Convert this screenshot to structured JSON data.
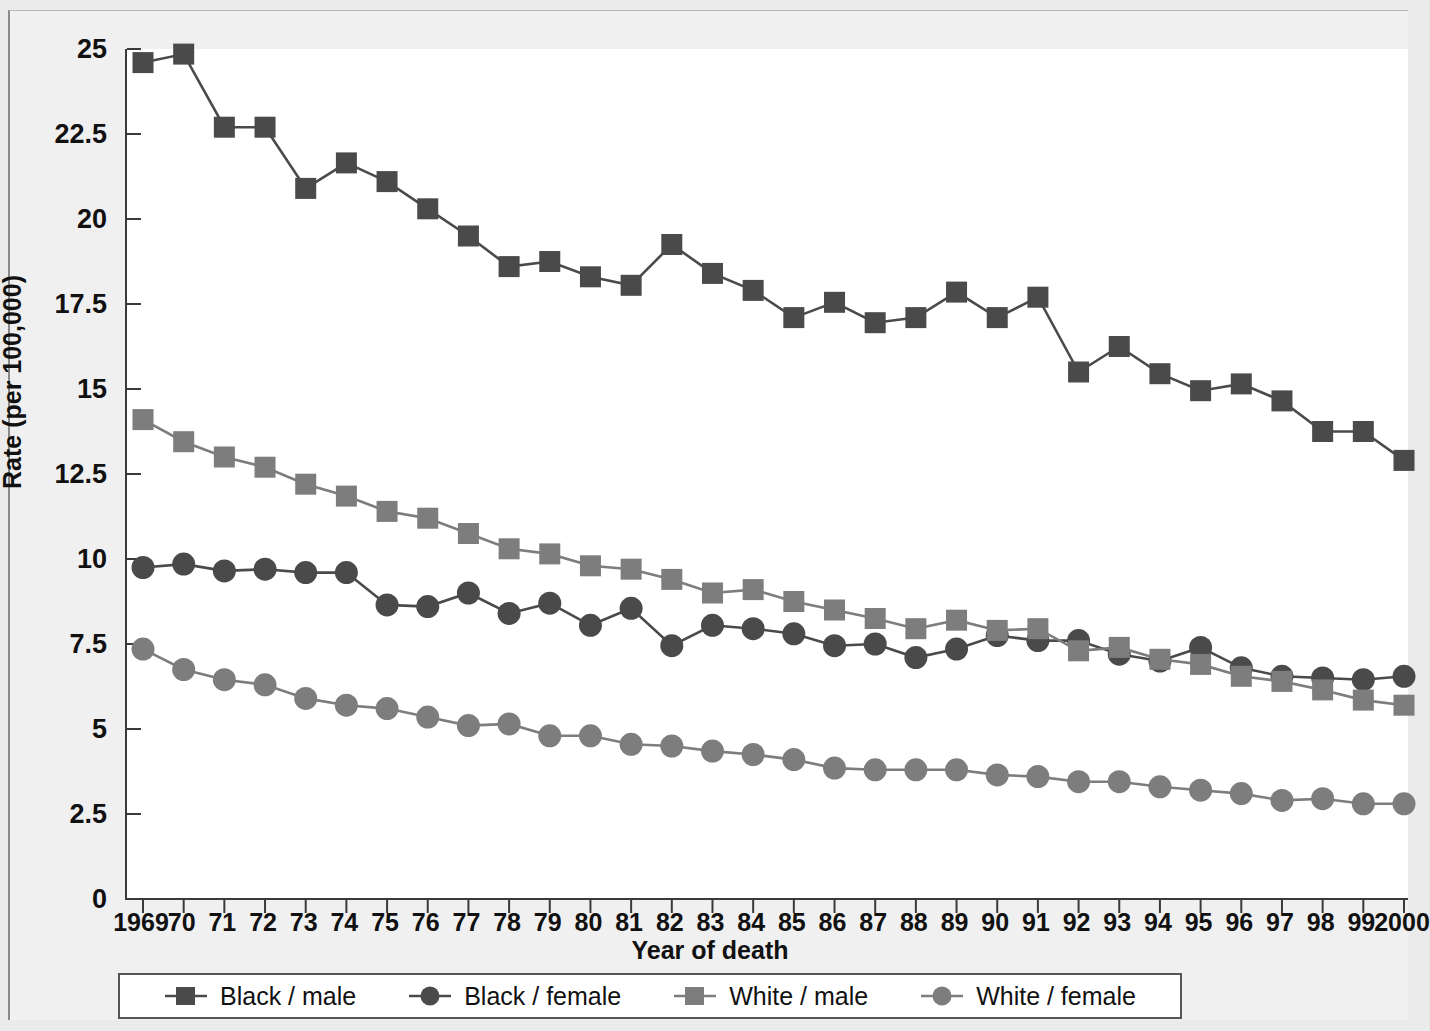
{
  "chart_data": {
    "type": "line",
    "title": "",
    "xlabel": "Year of death",
    "ylabel": "Rate (per 100,000)",
    "xlim": [
      1969,
      2000
    ],
    "ylim": [
      0,
      25
    ],
    "yticks": [
      0,
      2.5,
      5,
      7.5,
      10,
      12.5,
      15,
      17.5,
      20,
      22.5,
      25
    ],
    "ytick_labels": [
      "0",
      "2.5",
      "5",
      "7.5",
      "10",
      "12.5",
      "15",
      "17.5",
      "20",
      "22.5",
      "25"
    ],
    "grid": false,
    "legend_position": "below-axes",
    "x": [
      1969,
      1970,
      1971,
      1972,
      1973,
      1974,
      1975,
      1976,
      1977,
      1978,
      1979,
      1980,
      1981,
      1982,
      1983,
      1984,
      1985,
      1986,
      1987,
      1988,
      1989,
      1990,
      1991,
      1992,
      1993,
      1994,
      1995,
      1996,
      1997,
      1998,
      1999,
      2000
    ],
    "xtick_labels": [
      "1969",
      "70",
      "71",
      "72",
      "73",
      "74",
      "75",
      "76",
      "77",
      "78",
      "79",
      "80",
      "81",
      "82",
      "83",
      "84",
      "85",
      "86",
      "87",
      "88",
      "89",
      "90",
      "91",
      "92",
      "93",
      "94",
      "95",
      "96",
      "97",
      "98",
      "99",
      "2000"
    ],
    "series": [
      {
        "name": "Black / male",
        "marker": "square",
        "color": "#4a4a4a",
        "values": [
          24.6,
          24.85,
          22.7,
          22.7,
          20.9,
          21.65,
          21.1,
          20.3,
          19.5,
          18.6,
          18.75,
          18.3,
          18.05,
          19.25,
          18.4,
          17.9,
          17.1,
          17.55,
          16.95,
          17.1,
          17.85,
          17.1,
          17.7,
          15.5,
          16.25,
          15.45,
          14.95,
          15.15,
          14.65,
          13.75,
          13.75,
          12.9
        ]
      },
      {
        "name": "Black / female",
        "marker": "circle",
        "color": "#4a4a4a",
        "values": [
          9.75,
          9.85,
          9.65,
          9.7,
          9.6,
          9.6,
          8.65,
          8.6,
          9.0,
          8.4,
          8.7,
          8.05,
          8.55,
          7.45,
          8.05,
          7.95,
          7.8,
          7.45,
          7.5,
          7.1,
          7.35,
          7.75,
          7.6,
          7.6,
          7.2,
          7.0,
          7.4,
          6.8,
          6.55,
          6.5,
          6.45,
          6.55
        ]
      },
      {
        "name": "White / male",
        "marker": "square",
        "color": "#7d7d7d",
        "values": [
          14.1,
          13.45,
          13.0,
          12.7,
          12.2,
          11.85,
          11.4,
          11.2,
          10.75,
          10.3,
          10.15,
          9.8,
          9.7,
          9.4,
          9.0,
          9.1,
          8.75,
          8.5,
          8.25,
          7.95,
          8.2,
          7.9,
          7.95,
          7.3,
          7.4,
          7.05,
          6.9,
          6.55,
          6.4,
          6.15,
          5.85,
          5.7
        ]
      },
      {
        "name": "White / female",
        "marker": "circle",
        "color": "#7d7d7d",
        "values": [
          7.35,
          6.75,
          6.45,
          6.3,
          5.9,
          5.7,
          5.6,
          5.35,
          5.1,
          5.15,
          4.8,
          4.8,
          4.55,
          4.5,
          4.35,
          4.25,
          4.1,
          3.85,
          3.8,
          3.8,
          3.8,
          3.65,
          3.6,
          3.45,
          3.45,
          3.3,
          3.2,
          3.1,
          2.9,
          2.95,
          2.8,
          2.8
        ]
      }
    ]
  },
  "legend": {
    "items": [
      {
        "label": "Black / male"
      },
      {
        "label": "Black / female"
      },
      {
        "label": "White / male"
      },
      {
        "label": "White / female"
      }
    ]
  }
}
